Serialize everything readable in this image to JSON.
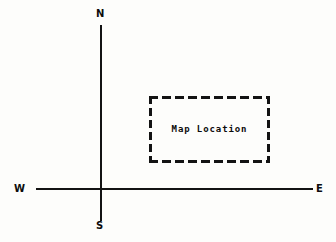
{
  "figure": {
    "background_color": "#fdfdfb",
    "ink_color": "#131313"
  },
  "compass": {
    "north_label": "N",
    "south_label": "S",
    "west_label": "W",
    "east_label": "E"
  },
  "map_box": {
    "label": "Map Location",
    "border_style": "dashed",
    "border_color": "#131313"
  },
  "chart_data": {
    "type": "diagram",
    "xlabel": "",
    "ylabel": "",
    "axes": [
      {
        "name": "vertical-axis",
        "orientation": "vertical",
        "positive_end_label": "N",
        "negative_end_label": "S",
        "x": 101,
        "y_start": 25,
        "y_end": 221
      },
      {
        "name": "horizontal-axis",
        "orientation": "horizontal",
        "positive_end_label": "E",
        "negative_end_label": "W",
        "y": 189,
        "x_start": 36,
        "x_end": 313
      }
    ],
    "origin": {
      "x": 101,
      "y": 189
    },
    "annotations": [
      {
        "name": "map-location-box",
        "label": "Map Location",
        "shape": "rectangle",
        "style": "dashed",
        "quadrant": "northeast",
        "left": 149,
        "top": 96,
        "width": 121,
        "height": 67
      }
    ],
    "grid": false,
    "legend": false
  }
}
